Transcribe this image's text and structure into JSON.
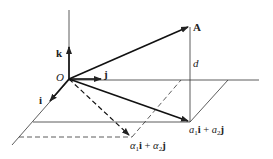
{
  "diagram": {
    "type": "3d-vector-decomposition",
    "labels": {
      "origin": "O",
      "vector_A": "A",
      "unit_i": "i",
      "unit_j": "j",
      "unit_k": "k",
      "distance": "d",
      "projection_a": {
        "coef1": "a",
        "sub1": "1",
        "basis1": "i",
        "plus": " + ",
        "coef2": "a",
        "sub2": "2",
        "basis2": "j"
      },
      "projection_alpha": {
        "coef1": "α",
        "sub1": "1",
        "basis1": "i",
        "plus": " + ",
        "coef2": "α",
        "sub2": "2",
        "basis2": "j"
      }
    },
    "colors": {
      "stroke": "#222222",
      "background": "#ffffff"
    }
  }
}
